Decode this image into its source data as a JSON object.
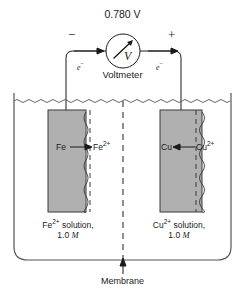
{
  "figure": {
    "voltage_reading": "0.780 V",
    "voltmeter_label": "Voltmeter",
    "voltmeter_glyph": "V",
    "negative_terminal": "−",
    "positive_terminal": "+",
    "electron_label_left": "e",
    "electron_label_right": "e",
    "electron_superscript": "−",
    "membrane_label": "Membrane"
  },
  "left_half_cell": {
    "electrode_metal": "Fe",
    "ion_species": "Fe",
    "ion_charge": "2+",
    "reaction_direction": "oxidation-right-arrow",
    "solution_line1_species": "Fe",
    "solution_line1_charge": "2+",
    "solution_line1_text": " solution,",
    "solution_concentration": "1.0 M",
    "concentration_value": "1.0",
    "concentration_unit": "M"
  },
  "right_half_cell": {
    "electrode_metal": "Cu",
    "ion_species": "Cu",
    "ion_charge": "2+",
    "reaction_direction": "reduction-left-arrow",
    "solution_line1_species": "Cu",
    "solution_line1_charge": "2+",
    "solution_line1_text": " solution,",
    "solution_concentration": "1.0 M",
    "concentration_value": "1.0",
    "concentration_unit": "M"
  },
  "colors": {
    "electrode_fill": "#b0b0b0",
    "line": "#1a1a1a",
    "text": "#1a1a1a",
    "background": "#ffffff"
  }
}
